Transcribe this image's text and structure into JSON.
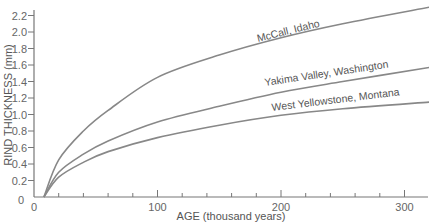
{
  "chart_data": {
    "type": "line",
    "title": "",
    "xlabel": "AGE (thousand years)",
    "ylabel": "RIND THICKNESS (mm)",
    "xlim": [
      0,
      320
    ],
    "ylim": [
      0,
      2.2
    ],
    "x_ticks": [
      0,
      100,
      200,
      300
    ],
    "x_minor_ticks": [
      20,
      40,
      60,
      80,
      120,
      140,
      160,
      180,
      220,
      240,
      260,
      280
    ],
    "y_ticks": [
      0,
      0.2,
      0.4,
      0.6,
      0.8,
      1.0,
      1.2,
      1.4,
      1.6,
      1.8,
      2.0,
      2.2
    ],
    "y_tick_labels": [
      "0",
      "0.2",
      "0.4",
      "0.6",
      "0.8",
      "1.0",
      "1.2",
      "1.4",
      "1.6",
      "1.8",
      "2.0",
      "2.2"
    ],
    "grid": false,
    "legend": "inline labels on curves",
    "series": [
      {
        "name": "McCall, Idaho",
        "x": [
          8,
          20,
          40,
          60,
          100,
          150,
          200,
          250,
          320
        ],
        "values": [
          0,
          0.45,
          0.8,
          1.05,
          1.45,
          1.72,
          1.93,
          2.1,
          2.3
        ]
      },
      {
        "name": "Yakima Valley, Washington",
        "x": [
          8,
          20,
          40,
          60,
          100,
          150,
          200,
          250,
          320
        ],
        "values": [
          0,
          0.3,
          0.52,
          0.68,
          0.91,
          1.1,
          1.27,
          1.4,
          1.57
        ]
      },
      {
        "name": "West Yellowstone, Montana",
        "x": [
          8,
          20,
          40,
          60,
          100,
          150,
          200,
          250,
          320
        ],
        "values": [
          0,
          0.24,
          0.42,
          0.55,
          0.72,
          0.87,
          0.99,
          1.07,
          1.15
        ]
      }
    ]
  },
  "labels": {
    "x_axis_title": "AGE (thousand years)",
    "y_axis_title": "RIND THICKNESS (mm)",
    "curve1": "McCall, Idaho",
    "curve2": "Yakima Valley, Washington",
    "curve3": "West Yellowstone, Montana",
    "x_origin_label": "0",
    "y_origin_label": "0"
  }
}
